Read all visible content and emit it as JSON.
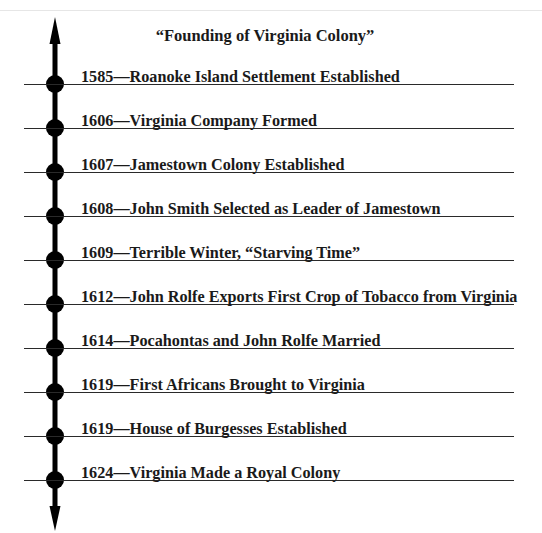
{
  "title": "“Founding of Virginia Colony”",
  "events": [
    {
      "year": "1585",
      "label": "1585—Roanoke Island Settlement Established"
    },
    {
      "year": "1606",
      "label": "1606—Virginia Company Formed"
    },
    {
      "year": "1607",
      "label": "1607—Jamestown Colony Established"
    },
    {
      "year": "1608",
      "label": "1608—John Smith Selected as Leader of Jamestown"
    },
    {
      "year": "1609",
      "label": "1609—Terrible Winter, “Starving Time”"
    },
    {
      "year": "1612",
      "label": "1612—John Rolfe Exports First Crop of Tobacco from Virginia"
    },
    {
      "year": "1614",
      "label": "1614—Pocahontas and John Rolfe Married"
    },
    {
      "year": "1619",
      "label": "1619—First Africans Brought to Virginia"
    },
    {
      "year": "1619",
      "label": "1619—House of Burgesses Established"
    },
    {
      "year": "1624",
      "label": "1624—Virginia Made a Royal Colony"
    }
  ],
  "colors": {
    "axis": "#000000",
    "line": "#2a2a2a",
    "text": "#1a1a1a"
  }
}
